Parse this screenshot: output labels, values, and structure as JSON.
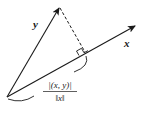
{
  "diagram": {
    "vectors": [
      {
        "name": "x",
        "label": "x"
      },
      {
        "name": "y",
        "label": "y"
      }
    ],
    "formula": {
      "numerator": "|(x, y)|",
      "denominator": "‖x‖"
    },
    "colors": {
      "stroke": "#1a1a1a",
      "background": "#ffffff"
    }
  }
}
